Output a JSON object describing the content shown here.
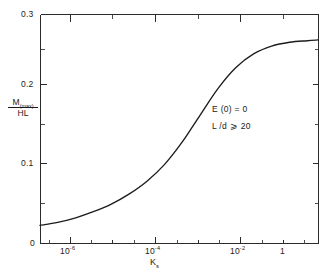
{
  "chart_data": {
    "type": "line",
    "title": "",
    "xlabel": "Kₛ",
    "ylabel": "M(max) / HL",
    "x_scale": "log",
    "y_scale": "linear",
    "xlim": [
      3.2e-08,
      2.0
    ],
    "ylim": [
      0,
      0.3
    ],
    "grid": false,
    "legend": null,
    "x_ticks_labeled": [
      1e-06,
      0.0001,
      0.01,
      1
    ],
    "x_tick_labels": [
      "10⁻⁶",
      "10⁻⁴",
      "10⁻²",
      "1"
    ],
    "y_ticks_labeled": [
      0,
      0.1,
      0.2,
      0.3
    ],
    "y_tick_labels": [
      "0",
      "0.1",
      "0.2",
      "0.3"
    ],
    "series": [
      {
        "name": "M(max)/HL",
        "x": [
          3.2e-08,
          1e-07,
          3.2e-07,
          1e-06,
          3.2e-06,
          1e-05,
          3.2e-05,
          0.0001,
          0.00032,
          0.001,
          0.0032,
          0.01,
          0.032,
          0.1,
          0.32,
          1.0,
          2.0
        ],
        "y": [
          0.023,
          0.027,
          0.033,
          0.041,
          0.051,
          0.064,
          0.081,
          0.103,
          0.133,
          0.168,
          0.203,
          0.23,
          0.248,
          0.258,
          0.263,
          0.265,
          0.266
        ]
      }
    ],
    "annotations": [
      {
        "text": "E (0) = 0",
        "x": 0.02,
        "y": 0.175
      },
      {
        "text": "L /d ⩾ 20",
        "x": 0.02,
        "y": 0.152
      }
    ]
  },
  "axes": {
    "y_labels": [
      {
        "text": "0.3",
        "id": "y-tick-label-03"
      },
      {
        "text": "0.2",
        "id": "y-tick-label-02"
      },
      {
        "text": "0.1",
        "id": "y-tick-label-01"
      },
      {
        "text": "0",
        "id": "y-tick-label-0"
      }
    ],
    "x_labels": [
      {
        "base": "10",
        "exp": "-6"
      },
      {
        "base": "10",
        "exp": "-4"
      },
      {
        "base": "10",
        "exp": "-2"
      },
      {
        "base": "1",
        "exp": ""
      }
    ],
    "ylabel_numerator_main": "M",
    "ylabel_numerator_sub": "(max)",
    "ylabel_denominator": "HL",
    "xlabel_main": "K",
    "xlabel_sub": "s"
  },
  "annotations": {
    "line_0": "E (0) = 0",
    "line_1": "L /d ⩾ 20"
  },
  "colors": {
    "curve": "#1c1c1c",
    "axis": "#2b2b2b",
    "background": "#ffffff",
    "text": "#1a1a1a"
  }
}
